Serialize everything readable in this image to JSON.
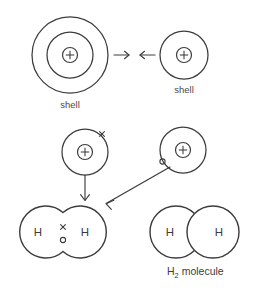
{
  "diagram": {
    "colors": {
      "background": "#ffffff",
      "stroke": "#3c3c3c",
      "label_text": "#4a4a4a"
    },
    "top_row": {
      "left_atom": {
        "nucleus_symbol": "+",
        "shell_count": 2,
        "label": "shell"
      },
      "right_atom": {
        "nucleus_symbol": "+",
        "shell_count": 1,
        "label": "shell"
      },
      "arrow_right_glyph": "→",
      "arrow_left_glyph": "←"
    },
    "middle_row": {
      "left_atom": {
        "nucleus_symbol": "+",
        "electron_symbol": "×"
      },
      "right_atom": {
        "nucleus_symbol": "+",
        "electron_symbol": "o"
      }
    },
    "bottom_row": {
      "bonded_molecule": {
        "left_atom_label": "H",
        "right_atom_label": "H",
        "shared_electron_top": "×",
        "shared_electron_bottom": "o"
      },
      "overlap_molecule": {
        "left_atom_label": "H",
        "right_atom_label": "H",
        "caption_main": "H",
        "caption_sub": "2",
        "caption_tail": " molecule",
        "caption_full": "H2 molecule"
      }
    }
  }
}
